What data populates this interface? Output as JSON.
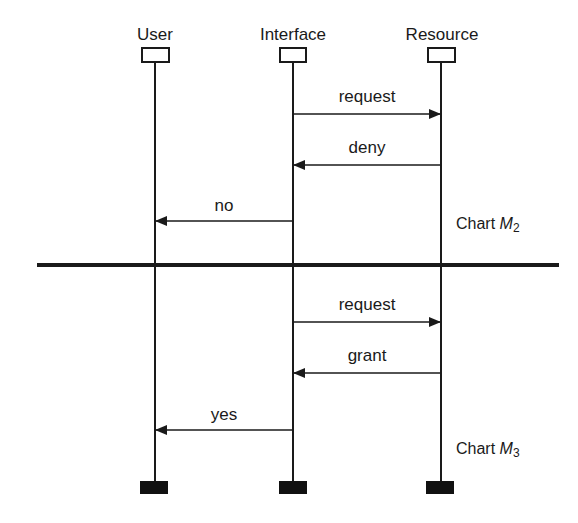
{
  "diagram": {
    "type": "message-sequence-chart",
    "actors": [
      {
        "name": "User",
        "x": 155
      },
      {
        "name": "Interface",
        "x": 293
      },
      {
        "name": "Resource",
        "x": 441
      }
    ],
    "divider": {
      "y": 265,
      "x1": 37,
      "x2": 559
    },
    "charts": [
      {
        "label_prefix": "Chart ",
        "label_var": "M",
        "label_sub": "2",
        "messages": [
          {
            "label": "request",
            "from": "Interface",
            "to": "Resource",
            "y": 114
          },
          {
            "label": "deny",
            "from": "Resource",
            "to": "Interface",
            "y": 165
          },
          {
            "label": "no",
            "from": "Interface",
            "to": "User",
            "y": 221
          }
        ]
      },
      {
        "label_prefix": "Chart ",
        "label_var": "M",
        "label_sub": "3",
        "messages": [
          {
            "label": "request",
            "from": "Interface",
            "to": "Resource",
            "y": 322
          },
          {
            "label": "grant",
            "from": "Resource",
            "to": "Interface",
            "y": 373
          },
          {
            "label": "yes",
            "from": "Interface",
            "to": "User",
            "y": 430
          }
        ]
      }
    ]
  }
}
